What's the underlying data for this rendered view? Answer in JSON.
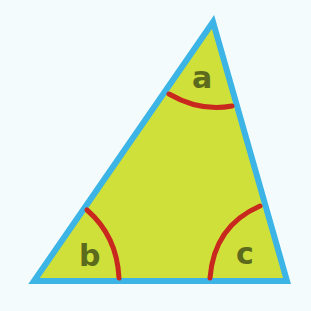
{
  "diagram": {
    "type": "triangle-angles",
    "colors": {
      "background": "#f3fbfc",
      "fill": "#cfe03a",
      "edge": "#3cb4e6",
      "arc": "#c8281e",
      "label": "#5b6a1c"
    },
    "vertices": {
      "top": [
        213,
        22
      ],
      "bottom_left": [
        34,
        281
      ],
      "bottom_right": [
        287,
        281
      ]
    },
    "angles": [
      {
        "id": "a",
        "label": "a",
        "vertex": "top"
      },
      {
        "id": "b",
        "label": "b",
        "vertex": "bottom_left"
      },
      {
        "id": "c",
        "label": "c",
        "vertex": "bottom_right"
      }
    ]
  }
}
